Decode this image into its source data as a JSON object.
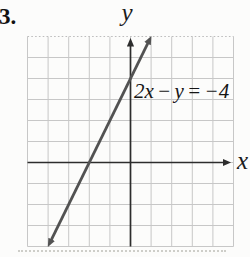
{
  "problem_number": "3.",
  "figure": {
    "y_axis_label": "y",
    "x_axis_label": "x",
    "equation_label": "2x − y = −4"
  },
  "chart_data": {
    "type": "line",
    "title": "",
    "equation": "2x − y = −4",
    "slope": 2,
    "x_intercept": -2,
    "y_intercept": 4,
    "xlim": [
      -5,
      5
    ],
    "ylim": [
      -4,
      6
    ],
    "grid": true,
    "grid_step": 1,
    "tick_labels_shown": false,
    "axis_labels": {
      "x": "x",
      "y": "y"
    },
    "line_segment_points": [
      [
        -4,
        -4
      ],
      [
        1,
        6
      ]
    ],
    "arrows": {
      "x_axis": "right",
      "y_axis": "up",
      "line": "both-ends"
    },
    "colors": {
      "grid": "#c7c7c7",
      "grid_top_edge": "#bdbdbd",
      "axis": "#2d2d2d",
      "line": "#525252",
      "text": "#151515",
      "background": "#fcfcfb"
    }
  }
}
